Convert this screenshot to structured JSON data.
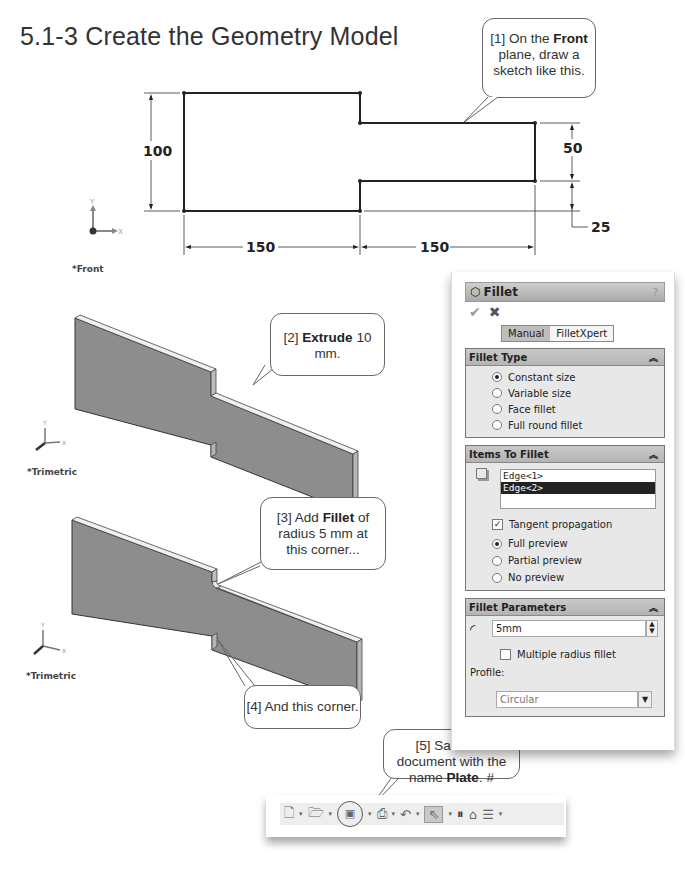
{
  "page": {
    "section_title": "5.1-3  Create the Geometry Model"
  },
  "callouts": {
    "c1": {
      "prefix": "[1] On the ",
      "bold": "Front",
      "suffix": " plane, draw a sketch like this."
    },
    "c2": {
      "prefix": "[2] ",
      "bold": "Extrude",
      "suffix": " 10 mm."
    },
    "c3": {
      "prefix": "[3] Add ",
      "bold": "Fillet",
      "suffix": " of radius 5 mm at this corner..."
    },
    "c4": {
      "text": "[4] And this corner."
    },
    "c5": {
      "prefix": "[5] Save the document with the name ",
      "bold": "Plate",
      "suffix": ". #"
    }
  },
  "sketch": {
    "dimensions": {
      "height": "100",
      "width_left": "150",
      "width_right": "150",
      "neck_height": "50",
      "neck_offset": "25"
    },
    "axis_x": "X",
    "axis_y": "Y",
    "view_label": "*Front"
  },
  "views": {
    "extrude_label": "*Trimetric",
    "fillet_label": "*Trimetric",
    "axis_x": "X",
    "axis_y": "Y",
    "axis_z": "Z"
  },
  "fillet_panel": {
    "title": "Fillet",
    "help_icon": "?",
    "ok_icon": "✔",
    "cancel_icon": "✖",
    "modes": [
      "Manual",
      "FilletXpert"
    ],
    "active_mode": "Manual",
    "fillet_type": {
      "header": "Fillet Type",
      "options": [
        "Constant size",
        "Variable size",
        "Face fillet",
        "Full round fillet"
      ],
      "selected": "Constant size"
    },
    "items_to_fillet": {
      "header": "Items To Fillet",
      "items": [
        "Edge<1>",
        "Edge<2>"
      ],
      "selected_item": "Edge<2>",
      "tangent_propagation_label": "Tangent propagation",
      "tangent_propagation_checked": true,
      "preview_options": [
        "Full preview",
        "Partial preview",
        "No preview"
      ],
      "preview_selected": "Full preview"
    },
    "fillet_parameters": {
      "header": "Fillet Parameters",
      "radius_value": "5mm",
      "multiple_radius_label": "Multiple radius fillet",
      "multiple_radius_checked": false,
      "profile_label": "Profile:",
      "profile_value": "Circular"
    }
  },
  "toolbar": {
    "buttons": [
      "new-document",
      "open",
      "save",
      "print",
      "undo",
      "select",
      "rebuild",
      "file-properties",
      "options"
    ]
  }
}
